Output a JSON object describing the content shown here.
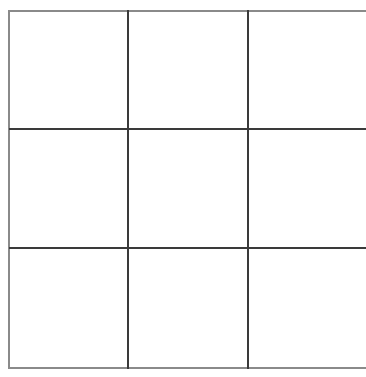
{
  "game": {
    "type": "tic-tac-toe",
    "grid_size": 3,
    "line_color": "#3a3a3a",
    "border_color": "#8a8a8a",
    "background": "#ffffff",
    "cells": [
      {
        "row": 0,
        "col": 0,
        "mark": ""
      },
      {
        "row": 0,
        "col": 1,
        "mark": ""
      },
      {
        "row": 0,
        "col": 2,
        "mark": ""
      },
      {
        "row": 1,
        "col": 0,
        "mark": ""
      },
      {
        "row": 1,
        "col": 1,
        "mark": ""
      },
      {
        "row": 1,
        "col": 2,
        "mark": ""
      },
      {
        "row": 2,
        "col": 0,
        "mark": ""
      },
      {
        "row": 2,
        "col": 1,
        "mark": ""
      },
      {
        "row": 2,
        "col": 2,
        "mark": ""
      }
    ]
  }
}
